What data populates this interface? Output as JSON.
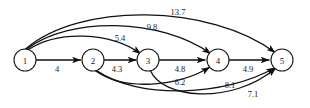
{
  "figure": {
    "kind": "directed-weighted-graph",
    "background_color": "#ffffff",
    "line_color": "#111111",
    "text_color": "#1a1a1a"
  },
  "nodes": [
    {
      "id": "1",
      "label": "1",
      "x": 25,
      "y": 60,
      "r": 11
    },
    {
      "id": "2",
      "label": "2",
      "x": 93,
      "y": 60,
      "r": 11
    },
    {
      "id": "3",
      "label": "3",
      "x": 148,
      "y": 60,
      "r": 11
    },
    {
      "id": "4",
      "label": "4",
      "x": 218,
      "y": 60,
      "r": 11
    },
    {
      "id": "5",
      "label": "5",
      "x": 282,
      "y": 60,
      "r": 11
    }
  ],
  "edges": [
    {
      "name": "edge-1-2",
      "from": "1",
      "to": "2",
      "weight": "4",
      "label_x": 57,
      "label_y": 69,
      "path": "M 36.2 60 L 80.5 60"
    },
    {
      "name": "edge-1-3",
      "from": "1",
      "to": "3",
      "weight": "5.4",
      "label_x": 120,
      "label_y": 38,
      "path": "M 28.5 49.5 C 58 30, 110 32, 140.5 53.5"
    },
    {
      "name": "edge-1-4",
      "from": "1",
      "to": "4",
      "weight": "9.8",
      "label_x": 152,
      "label_y": 27,
      "path": "M 26.5 49.2 C 70 16, 160 18, 210.5 53.5"
    },
    {
      "name": "edge-1-5",
      "from": "1",
      "to": "5",
      "weight": "13.7",
      "label_x": 178,
      "label_y": 12,
      "path": "M 25.5 49.1 C 80 2, 210 4, 275 52.5"
    },
    {
      "name": "edge-2-3",
      "from": "2",
      "to": "3",
      "weight": "4.3",
      "label_x": 117,
      "label_y": 69,
      "path": "M 104.2 60 L 136 60"
    },
    {
      "name": "edge-2-4",
      "from": "2",
      "to": "4",
      "weight": "6.2",
      "label_x": 180,
      "label_y": 82,
      "path": "M 95.5 70.8 C 125 92, 178 86, 209.5 67.5"
    },
    {
      "name": "edge-2-5",
      "from": "2",
      "to": "5",
      "weight": "8.1",
      "label_x": 230,
      "label_y": 85,
      "path": "M 96.5 70.6 C 140 100, 225 96, 274.5 68"
    },
    {
      "name": "edge-3-4",
      "from": "3",
      "to": "4",
      "weight": "4.8",
      "label_x": 180,
      "label_y": 69,
      "path": "M 159.2 60 L 205 60"
    },
    {
      "name": "edge-3-5",
      "from": "3",
      "to": "5",
      "weight": "7.1",
      "label_x": 253,
      "label_y": 94,
      "path": "M 150.5 70.8 C 162 98, 230 106, 275.5 68.5"
    },
    {
      "name": "edge-4-5",
      "from": "4",
      "to": "5",
      "weight": "4.9",
      "label_x": 248,
      "label_y": 69,
      "path": "M 229.2 60 L 269 60"
    }
  ],
  "arrow_marker": {
    "name": "arrowhead",
    "width": 7,
    "height": 5
  }
}
